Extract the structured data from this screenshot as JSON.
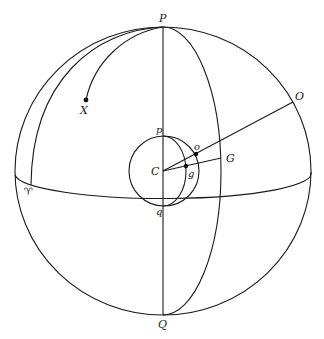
{
  "diagram": {
    "type": "celestial-sphere",
    "labels": {
      "north_pole": "P",
      "south_pole": "Q",
      "center": "C",
      "star": "X",
      "observer_direction": "O",
      "g_direction": "G",
      "small_north": "p",
      "small_south": "q",
      "small_o": "o",
      "small_g": "g",
      "vernal_equinox": "♈"
    },
    "elements": [
      "outer celestial sphere",
      "polar axis P–Q",
      "celestial equator",
      "meridian through G",
      "meridian through vernal equinox",
      "arc from P to X",
      "inner sphere p–q centered at C",
      "inner meridian through g",
      "line C–O through o",
      "line C–G through g"
    ],
    "colors": {
      "ink": "#1a1a1a",
      "background": "#ffffff"
    }
  }
}
